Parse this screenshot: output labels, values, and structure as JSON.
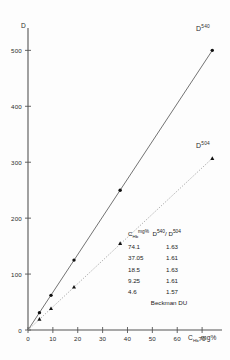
{
  "figure": {
    "caption": ""
  },
  "chart_data": {
    "type": "scatter",
    "title": "",
    "xlabel": "C_Hb mg%",
    "ylabel": "D",
    "xlabel_main": "C",
    "xlabel_sub": "Hb",
    "xlabel_unit": "mg%",
    "xlim": [
      0,
      78
    ],
    "ylim": [
      0,
      540
    ],
    "xticks": [
      0,
      10,
      20,
      30,
      40,
      50,
      60,
      70
    ],
    "yticks": [
      0,
      100,
      200,
      300,
      400,
      500
    ],
    "grid": false,
    "legend": "inline-labels",
    "series": [
      {
        "name": "D540",
        "label_base": "D",
        "label_sup": "540",
        "marker": "filled-circle",
        "line": "solid",
        "x": [
          4.6,
          9.25,
          18.5,
          37.05,
          74.1
        ],
        "y": [
          31,
          62,
          125,
          250,
          500
        ]
      },
      {
        "name": "D504",
        "label_base": "D",
        "label_sup": "504",
        "marker": "filled-triangle",
        "line": "dotted",
        "x": [
          4.6,
          9.25,
          18.5,
          37.05,
          74.1
        ],
        "y": [
          19.5,
          38.5,
          77,
          155,
          307
        ]
      }
    ]
  },
  "table": {
    "header": {
      "col1_base": "C",
      "col1_sub": "Hb",
      "col1_unit": "mg%",
      "col2_base": "D",
      "col2_sup": "540",
      "col2_sep": "/",
      "col2_base2": "D",
      "col2_sup2": "504"
    },
    "rows": [
      {
        "chb": "74.1",
        "ratio": "1.63"
      },
      {
        "chb": "37.05",
        "ratio": "1.61"
      },
      {
        "chb": "18.5",
        "ratio": "1.63"
      },
      {
        "chb": "9.25",
        "ratio": "1.61"
      },
      {
        "chb": "4.6",
        "ratio": "1.57"
      }
    ],
    "footer": "Beckman DU"
  },
  "axes": {
    "y_title": "D",
    "y_ticks": [
      "500",
      "400",
      "300",
      "200",
      "100",
      "0"
    ],
    "x_ticks": [
      "0",
      "10",
      "20",
      "30",
      "40",
      "50",
      "60",
      "70"
    ]
  },
  "colors": {
    "axis": "#555555",
    "solid_line": "#5a5a5a",
    "dotted_line": "#8a8a8a",
    "marker": "#111111",
    "text": "#2b2b2b"
  }
}
